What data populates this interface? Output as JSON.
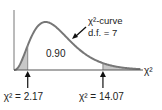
{
  "chart_data": {
    "type": "area",
    "title": "",
    "distribution": "chi-square",
    "df": 7,
    "xlabel": "χ²",
    "xlim": [
      0,
      20
    ],
    "curve_label": "χ²-curve",
    "df_label": "d.f. = 7",
    "center_area_label": "0.90",
    "cutoffs": [
      {
        "value": 2.17,
        "label": "χ² = 2.17",
        "tail": "left",
        "area": 0.05
      },
      {
        "value": 14.07,
        "label": "χ² = 14.07",
        "tail": "right",
        "area": 0.05
      }
    ]
  },
  "colors": {
    "curve": "#777777",
    "shade": "#c8c8c8",
    "axis": "#555555"
  }
}
